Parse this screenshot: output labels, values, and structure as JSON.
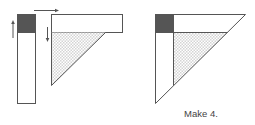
{
  "caption": "Make 4.",
  "colors": {
    "stroke": "#555555",
    "dark_square": "#555555",
    "hatch": "#d4d4d4",
    "background": "#ffffff"
  },
  "figures": [
    {
      "name": "exploded-assembly",
      "parts": [
        "vertical-strip-with-dark-square",
        "horizontal-strip",
        "hatched-triangle"
      ],
      "arrows": [
        "up",
        "right",
        "down"
      ]
    },
    {
      "name": "assembled-triangle",
      "parts": [
        "dark-square",
        "top-strip",
        "left-strip",
        "hatched-triangle"
      ]
    }
  ]
}
